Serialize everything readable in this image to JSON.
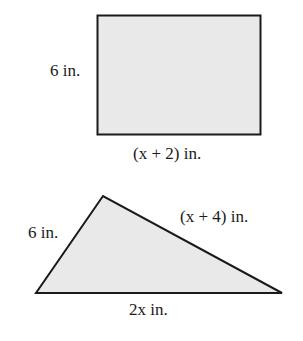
{
  "figures": {
    "rectangle": {
      "side_label": "6 in.",
      "bottom_label": "(x + 2) in.",
      "fill": "#e9e9e9",
      "stroke": "#1a1a1a"
    },
    "triangle": {
      "left_label": "6 in.",
      "right_label": "(x + 4) in.",
      "bottom_label": "2x in.",
      "fill": "#e9e9e9",
      "stroke": "#1a1a1a"
    }
  }
}
